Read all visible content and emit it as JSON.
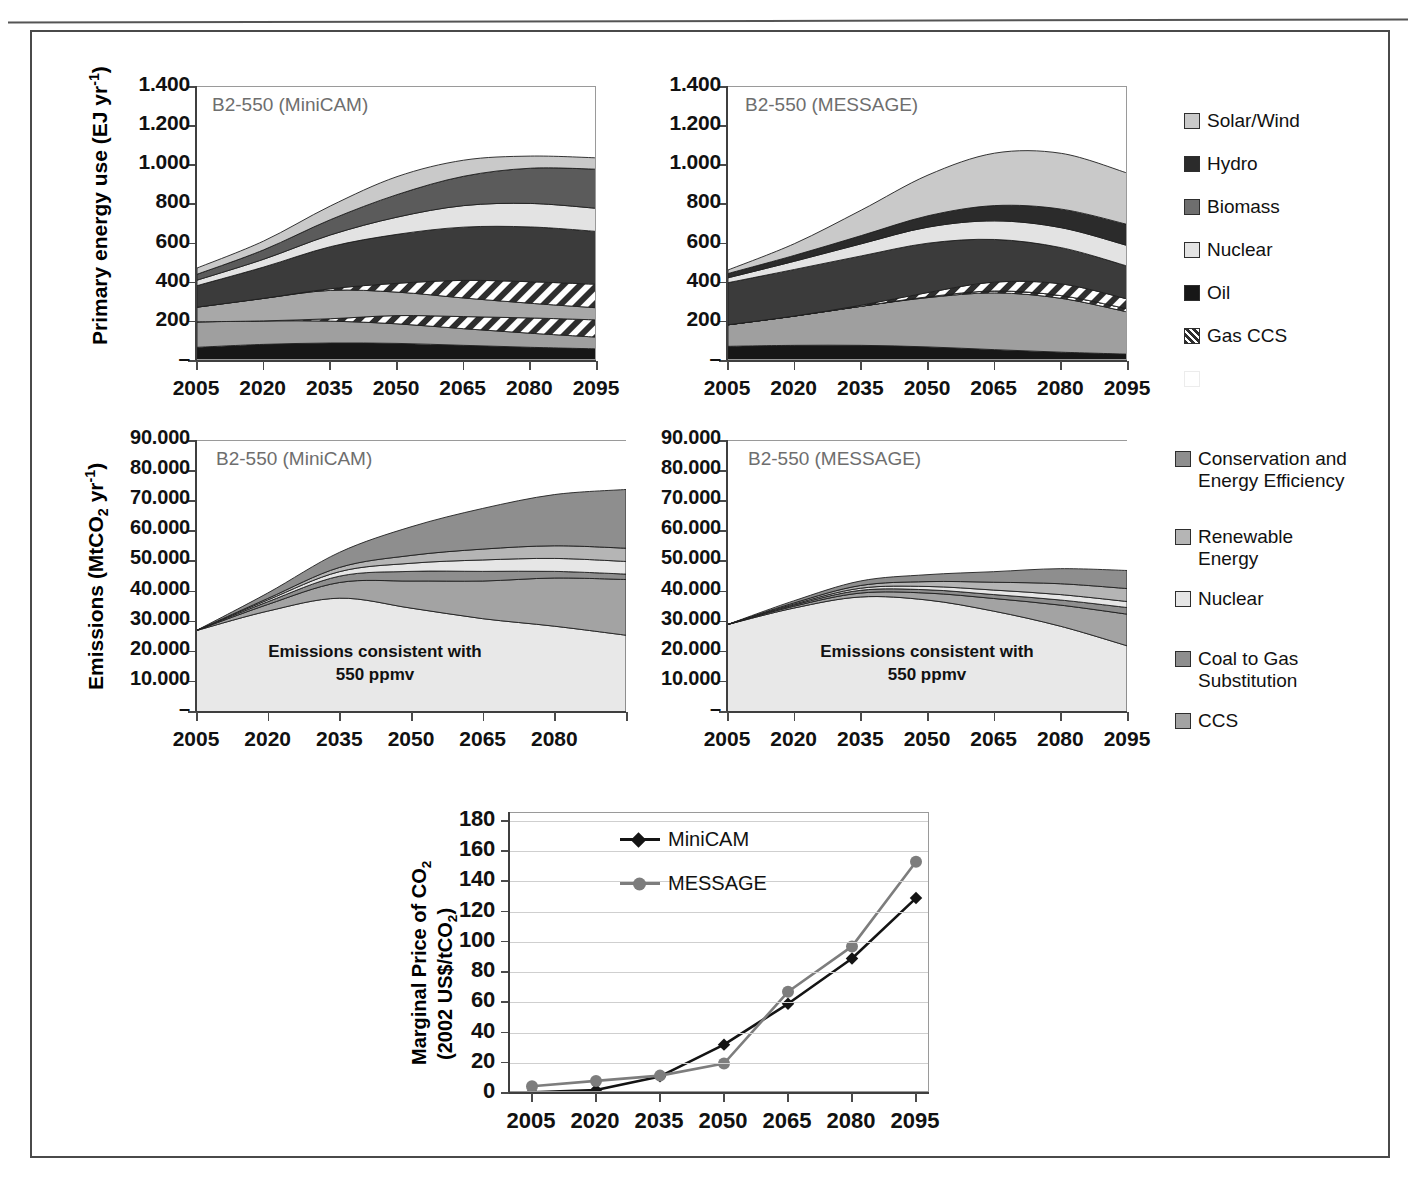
{
  "running_head": "",
  "panels": {
    "energy_left": {
      "title": "B2-550 (MiniCAM)"
    },
    "energy_right": {
      "title": "B2-550 (MESSAGE)"
    },
    "emis_left": {
      "title": "B2-550 (MiniCAM)",
      "annotation_line1": "Emissions consistent with",
      "annotation_line2": "550 ppmv"
    },
    "emis_right": {
      "title": "B2-550 (MESSAGE)",
      "annotation_line1": "Emissions consistent with",
      "annotation_line2": "550 ppmv"
    }
  },
  "axis_titles": {
    "energy": {
      "pre": "Primary energy use (EJ yr",
      "sup": "-1",
      "post": ")"
    },
    "emissions": {
      "pre": "Emissions (MtCO",
      "sub": "2",
      "mid": " yr",
      "sup": "-1",
      "post": ")"
    },
    "price_line1_pre": "Marginal Price of CO",
    "price_line1_sub": "2",
    "price_line2_pre": "(2002 US$/tCO",
    "price_line2_sub": "2",
    "price_line2_post": ")"
  },
  "legends": {
    "energy": {
      "items": [
        {
          "label": "Solar/Wind",
          "color": "#c9c9c9",
          "pattern": "solid"
        },
        {
          "label": "Hydro",
          "color": "#2b2b2b",
          "pattern": "solid"
        },
        {
          "label": "Biomass",
          "color": "#6e6e6e",
          "pattern": "solid"
        },
        {
          "label": "Nuclear",
          "color": "#e3e3e3",
          "pattern": "solid"
        },
        {
          "label": "Oil",
          "color": "#171717",
          "pattern": "solid"
        },
        {
          "label": "Gas CCS",
          "color": "#ffffff",
          "pattern": "hatch"
        },
        {
          "label": "",
          "color": "#ffffff",
          "pattern": "solid",
          "ghost": true
        }
      ]
    },
    "emissions": {
      "items": [
        {
          "label": "Conservation and\nEnergy Efficiency",
          "color": "#8e8e8e",
          "pattern": "solid"
        },
        {
          "label": "Renewable\nEnergy",
          "color": "#b5b5b5",
          "pattern": "solid"
        },
        {
          "label": "Nuclear",
          "color": "#e6e6e6",
          "pattern": "solid"
        },
        {
          "label": "Coal to Gas\nSubstitution",
          "color": "#8e8e8e",
          "pattern": "solid"
        },
        {
          "label": "CCS",
          "color": "#a3a3a3",
          "pattern": "solid"
        }
      ]
    }
  },
  "chart_data": [
    {
      "id": "energy-minicam",
      "type": "area",
      "title": "B2-550 (MiniCAM)",
      "ylabel": "Primary energy use (EJ yr-1)",
      "xlabel": "",
      "x": [
        2005,
        2020,
        2035,
        2050,
        2065,
        2080,
        2095
      ],
      "xtick_labels": [
        "2005",
        "2020",
        "2035",
        "2050",
        "2065",
        "2080",
        "2095"
      ],
      "ytick_labels": [
        "–",
        "200",
        "400",
        "600",
        "800",
        "1.000",
        "1.200",
        "1.400"
      ],
      "ytick_values": [
        0,
        200,
        400,
        600,
        800,
        1000,
        1200,
        1400
      ],
      "ylim": [
        0,
        1400
      ],
      "grid": false,
      "stack_order_bottom_to_top": [
        "Oil",
        "Coal",
        "Coal CCS",
        "Gas",
        "Gas CCS",
        "Biomass",
        "Nuclear",
        "Hydro",
        "Solar/Wind"
      ],
      "series": [
        {
          "name": "Oil",
          "color": "#171717",
          "pattern": "solid",
          "values": [
            70,
            85,
            92,
            90,
            80,
            70,
            62
          ]
        },
        {
          "name": "Coal",
          "color": "#9f9f9f",
          "pattern": "solid",
          "values": [
            130,
            120,
            112,
            100,
            85,
            72,
            60
          ]
        },
        {
          "name": "Coal CCS",
          "color": "#ffffff",
          "pattern": "hatch",
          "values": [
            0,
            0,
            12,
            42,
            62,
            78,
            88
          ]
        },
        {
          "name": "Gas",
          "color": "#a8a8a8",
          "pattern": "solid",
          "values": [
            75,
            115,
            145,
            120,
            95,
            75,
            62
          ]
        },
        {
          "name": "Gas CCS",
          "color": "#ffffff",
          "pattern": "hatch",
          "values": [
            0,
            0,
            8,
            45,
            90,
            110,
            120
          ]
        },
        {
          "name": "Biomass",
          "color": "#3b3b3b",
          "pattern": "solid",
          "values": [
            110,
            160,
            215,
            250,
            272,
            280,
            270
          ]
        },
        {
          "name": "Nuclear",
          "color": "#e3e3e3",
          "pattern": "solid",
          "values": [
            28,
            40,
            60,
            88,
            110,
            120,
            118
          ]
        },
        {
          "name": "Hydro",
          "color": "#5b5b5b",
          "pattern": "solid",
          "values": [
            30,
            48,
            78,
            115,
            150,
            180,
            200
          ]
        },
        {
          "name": "Solar/Wind",
          "color": "#c9c9c9",
          "pattern": "solid",
          "values": [
            32,
            45,
            70,
            92,
            82,
            62,
            58
          ]
        }
      ],
      "totals": [
        475,
        613,
        792,
        942,
        1026,
        1047,
        1038
      ]
    },
    {
      "id": "energy-message",
      "type": "area",
      "title": "B2-550 (MESSAGE)",
      "ylabel": "Primary energy use (EJ yr-1)",
      "xlabel": "",
      "x": [
        2005,
        2020,
        2035,
        2050,
        2065,
        2080,
        2095
      ],
      "xtick_labels": [
        "2005",
        "2020",
        "2035",
        "2050",
        "2065",
        "2080",
        "2095"
      ],
      "ytick_labels": [
        "–",
        "200",
        "400",
        "600",
        "800",
        "1.000",
        "1.200",
        "1.400"
      ],
      "ytick_values": [
        0,
        200,
        400,
        600,
        800,
        1000,
        1200,
        1400
      ],
      "ylim": [
        0,
        1400
      ],
      "grid": false,
      "series": [
        {
          "name": "Oil",
          "color": "#171717",
          "pattern": "solid",
          "values": [
            75,
            80,
            80,
            72,
            58,
            45,
            35
          ]
        },
        {
          "name": "Coal",
          "color": "#9f9f9f",
          "pattern": "solid",
          "values": [
            110,
            150,
            200,
            252,
            290,
            275,
            215
          ]
        },
        {
          "name": "Coal CCS",
          "color": "#ffffff",
          "pattern": "hatch",
          "values": [
            0,
            0,
            0,
            4,
            10,
            14,
            16
          ]
        },
        {
          "name": "Gas",
          "color": "#a8a8a8",
          "pattern": "solid",
          "values": [
            0,
            0,
            0,
            0,
            0,
            0,
            0
          ]
        },
        {
          "name": "Gas CCS",
          "color": "#ffffff",
          "pattern": "hatch",
          "values": [
            0,
            0,
            5,
            22,
            45,
            60,
            50
          ]
        },
        {
          "name": "Biomass",
          "color": "#3b3b3b",
          "pattern": "solid",
          "values": [
            215,
            238,
            252,
            252,
            218,
            185,
            168
          ]
        },
        {
          "name": "Nuclear",
          "color": "#e3e3e3",
          "pattern": "solid",
          "values": [
            25,
            42,
            62,
            82,
            95,
            102,
            105
          ]
        },
        {
          "name": "Hydro",
          "color": "#2b2b2b",
          "pattern": "solid",
          "values": [
            22,
            30,
            42,
            58,
            78,
            95,
            108
          ]
        },
        {
          "name": "Solar/Wind",
          "color": "#c9c9c9",
          "pattern": "solid",
          "values": [
            18,
            60,
            130,
            208,
            268,
            285,
            262
          ]
        }
      ],
      "totals": [
        465,
        600,
        771,
        950,
        1062,
        1061,
        959
      ]
    },
    {
      "id": "emissions-minicam",
      "type": "area",
      "title": "B2-550 (MiniCAM)",
      "ylabel": "Emissions (MtCO2 yr-1)",
      "annotation": "Emissions consistent with 550 ppmv",
      "x": [
        2005,
        2020,
        2035,
        2050,
        2065,
        2080,
        2095
      ],
      "xtick_labels": [
        "2005",
        "2020",
        "2035",
        "2050",
        "2065",
        "2080"
      ],
      "ytick_labels": [
        "–",
        "10.000",
        "20.000",
        "30.000",
        "40.000",
        "50.000",
        "60.000",
        "70.000",
        "80.000",
        "90.000"
      ],
      "ytick_values": [
        0,
        10000,
        20000,
        30000,
        40000,
        50000,
        60000,
        70000,
        80000,
        90000
      ],
      "ylim": [
        0,
        90000
      ],
      "grid": false,
      "baseline_name": "Emissions consistent with 550 ppmv",
      "series": [
        {
          "name": "550 ppmv emissions",
          "color": "#e8e8e8",
          "pattern": "solid",
          "values": [
            27000,
            33500,
            37800,
            34500,
            31000,
            28500,
            25500
          ]
        },
        {
          "name": "CCS",
          "color": "#a3a3a3",
          "pattern": "solid",
          "values": [
            0,
            2200,
            5200,
            9000,
            12500,
            16000,
            18500
          ]
        },
        {
          "name": "Coal to Gas Substitution",
          "color": "#8e8e8e",
          "pattern": "solid",
          "values": [
            0,
            900,
            2100,
            3200,
            3200,
            2200,
            1800
          ]
        },
        {
          "name": "Nuclear",
          "color": "#e6e6e6",
          "pattern": "solid",
          "values": [
            0,
            600,
            1500,
            2700,
            3800,
            4300,
            4200
          ]
        },
        {
          "name": "Renewable Energy",
          "color": "#b5b5b5",
          "pattern": "solid",
          "values": [
            0,
            500,
            1400,
            2600,
            3600,
            4200,
            4400
          ]
        },
        {
          "name": "Conservation and Energy Efficiency",
          "color": "#8e8e8e",
          "pattern": "solid",
          "values": [
            0,
            1800,
            5000,
            9500,
            13500,
            17000,
            19500
          ]
        }
      ],
      "totals": [
        27000,
        39500,
        53000,
        61500,
        67600,
        72200,
        73900
      ]
    },
    {
      "id": "emissions-message",
      "type": "area",
      "title": "B2-550 (MESSAGE)",
      "ylabel": "Emissions (MtCO2 yr-1)",
      "annotation": "Emissions consistent with 550 ppmv",
      "x": [
        2005,
        2020,
        2035,
        2050,
        2065,
        2080,
        2095
      ],
      "xtick_labels": [
        "2005",
        "2020",
        "2035",
        "2050",
        "2065",
        "2080",
        "2095"
      ],
      "ytick_labels": [
        "–",
        "10.000",
        "20.000",
        "30.000",
        "40.000",
        "50.000",
        "60.000",
        "70.000",
        "80.000",
        "90.000"
      ],
      "ytick_values": [
        0,
        10000,
        20000,
        30000,
        40000,
        50000,
        60000,
        70000,
        80000,
        90000
      ],
      "ylim": [
        0,
        90000
      ],
      "grid": false,
      "series": [
        {
          "name": "550 ppmv emissions",
          "color": "#e8e8e8",
          "pattern": "solid",
          "values": [
            29000,
            34500,
            38200,
            37200,
            33500,
            28500,
            22000
          ]
        },
        {
          "name": "CCS",
          "color": "#a3a3a3",
          "pattern": "solid",
          "values": [
            0,
            600,
            1300,
            2300,
            4200,
            7000,
            10500
          ]
        },
        {
          "name": "Coal to Gas Substitution",
          "color": "#8e8e8e",
          "pattern": "solid",
          "values": [
            0,
            400,
            900,
            1100,
            1300,
            1700,
            2200
          ]
        },
        {
          "name": "Nuclear",
          "color": "#e6e6e6",
          "pattern": "solid",
          "values": [
            0,
            300,
            700,
            1100,
            1500,
            1800,
            2000
          ]
        },
        {
          "name": "Renewable Energy",
          "color": "#b5b5b5",
          "pattern": "solid",
          "values": [
            0,
            400,
            900,
            1600,
            2600,
            3600,
            4300
          ]
        },
        {
          "name": "Conservation and Energy Efficiency",
          "color": "#8e8e8e",
          "pattern": "solid",
          "values": [
            0,
            700,
            1500,
            2300,
            3500,
            5000,
            6000
          ]
        }
      ],
      "totals": [
        29000,
        36900,
        43500,
        45600,
        46600,
        47600,
        47000
      ]
    },
    {
      "id": "carbon-price",
      "type": "line",
      "title": "",
      "ylabel": "Marginal Price of CO2 (2002 US$/tCO2)",
      "x": [
        2005,
        2020,
        2035,
        2050,
        2065,
        2080,
        2095
      ],
      "xtick_labels": [
        "2005",
        "2020",
        "2035",
        "2050",
        "2065",
        "2080",
        "2095"
      ],
      "ytick_labels": [
        "0",
        "20",
        "40",
        "60",
        "80",
        "100",
        "120",
        "140",
        "160",
        "180"
      ],
      "ytick_values": [
        0,
        20,
        40,
        60,
        80,
        100,
        120,
        140,
        160,
        180
      ],
      "ylim": [
        0,
        180
      ],
      "grid": true,
      "series": [
        {
          "name": "MiniCAM",
          "color": "#141414",
          "marker": "diamond",
          "values": [
            0.5,
            2,
            11,
            32,
            59,
            89,
            129
          ]
        },
        {
          "name": "MESSAGE",
          "color": "#7d7d7d",
          "marker": "circle",
          "values": [
            4.5,
            8,
            11.5,
            19.5,
            67,
            97,
            153
          ]
        }
      ]
    }
  ]
}
